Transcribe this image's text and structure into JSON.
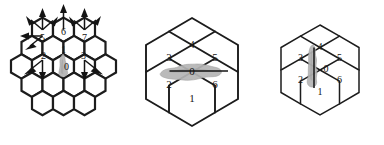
{
  "figure": {
    "background_color": "#ffffff",
    "panel_count": 3
  },
  "style": {
    "hex_stroke_color": "#1c1c1c",
    "hex_fill_color": "#ffffff",
    "label_color": "#151515",
    "blob_color": "#b5b5b5",
    "blob_shade_color": "#9e9e9e",
    "arrow_color": "#141414"
  },
  "panels": [
    {
      "id": "left",
      "name": "arrow-grid-panel",
      "grid_type": "hexagonal-19-cell",
      "cell_count": 19,
      "orientation": "pointy-top",
      "has_arrows": true,
      "arrow_count": 14,
      "blob": {
        "orientation": "vertical",
        "label": "0",
        "position": "center"
      },
      "labels": [
        {
          "text": "0",
          "position": "center",
          "ring": 0
        },
        {
          "text": "1",
          "position": "upper-center",
          "ring": 1
        },
        {
          "text": "2",
          "position": "left",
          "ring": 1
        },
        {
          "text": "3",
          "position": "right",
          "ring": 1
        },
        {
          "text": "5",
          "position": "upper-left",
          "ring": 2
        },
        {
          "text": "6",
          "position": "top",
          "ring": 2
        },
        {
          "text": "7",
          "position": "upper-right",
          "ring": 2
        }
      ]
    },
    {
      "id": "middle",
      "name": "horizontal-blob-panel",
      "grid_type": "hexagonal-7-cell-flower",
      "cell_count": 7,
      "orientation": "pointy-top",
      "has_arrows": false,
      "blob": {
        "orientation": "horizontal",
        "label": "0",
        "position": "center"
      },
      "labels": [
        {
          "text": "0",
          "position": "center"
        },
        {
          "text": "1",
          "position": "bottom"
        },
        {
          "text": "2",
          "position": "lower-left"
        },
        {
          "text": "3",
          "position": "upper-left"
        },
        {
          "text": "4",
          "position": "top"
        },
        {
          "text": "5",
          "position": "upper-right"
        },
        {
          "text": "6",
          "position": "lower-right"
        }
      ]
    },
    {
      "id": "right",
      "name": "vertical-blob-panel",
      "grid_type": "hexagonal-7-cell-flower",
      "cell_count": 7,
      "orientation": "pointy-top",
      "has_arrows": false,
      "blob": {
        "orientation": "vertical",
        "label": "0",
        "position": "center-left"
      },
      "labels": [
        {
          "text": "0",
          "position": "center"
        },
        {
          "text": "1",
          "position": "bottom"
        },
        {
          "text": "2",
          "position": "lower-left"
        },
        {
          "text": "3",
          "position": "upper-left"
        },
        {
          "text": "4",
          "position": "top"
        },
        {
          "text": "5",
          "position": "upper-right"
        },
        {
          "text": "6",
          "position": "lower-right"
        }
      ]
    }
  ],
  "left_panel_labels": {
    "l0": "0",
    "l1": "1",
    "l2": "2",
    "l3": "3",
    "l5": "5",
    "l6": "6",
    "l7": "7"
  },
  "middle_panel_labels": {
    "m0": "0",
    "m1": "1",
    "m2": "2",
    "m3": "3",
    "m4": "4",
    "m5": "5",
    "m6": "6"
  },
  "right_panel_labels": {
    "r0": "0",
    "r1": "1",
    "r2": "2",
    "r3": "3",
    "r4": "4",
    "r5": "5",
    "r6": "6"
  }
}
